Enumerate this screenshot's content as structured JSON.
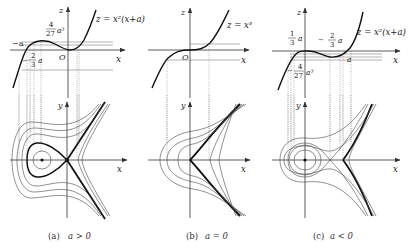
{
  "figure": {
    "panels": [
      {
        "id": "a",
        "caption": "(a)  a > 0",
        "caption_tag": "(a)",
        "caption_cond": "a > 0",
        "upper": {
          "axis_z": "z",
          "axis_x": "x",
          "origin": "O",
          "curve_label": "z = x²(x+a)",
          "labels": [
            {
              "text": "−a",
              "role": "root"
            },
            {
              "text": "4",
              "role": "max-num"
            },
            {
              "text": "27",
              "role": "max-den"
            },
            {
              "text": "a³",
              "role": "max-var"
            },
            {
              "text": "2",
              "role": "crit-num"
            },
            {
              "text": "3",
              "role": "crit-den"
            },
            {
              "text": "a",
              "role": "crit-var"
            }
          ]
        },
        "lower": {
          "axis_y": "y",
          "axis_x": "x"
        }
      },
      {
        "id": "b",
        "caption": "(b)  a = 0",
        "caption_tag": "(b)",
        "caption_cond": "a = 0",
        "upper": {
          "axis_z": "z",
          "axis_x": "x",
          "origin": "O",
          "curve_label": "z = x³"
        },
        "lower": {
          "axis_y": "y",
          "axis_x": "x"
        }
      },
      {
        "id": "c",
        "caption": "(c)  a < 0",
        "caption_tag": "(c)",
        "caption_cond": "a < 0",
        "upper": {
          "axis_z": "z",
          "axis_x": "x",
          "curve_label": "z = x²(x+a)",
          "labels": [
            {
              "text": "1",
              "role": "a3-num"
            },
            {
              "text": "3",
              "role": "a3-den"
            },
            {
              "text": "a",
              "role": "a3-var"
            },
            {
              "text": "−",
              "role": "crit-sign"
            },
            {
              "text": "2",
              "role": "crit-num"
            },
            {
              "text": "3",
              "role": "crit-den"
            },
            {
              "text": "a",
              "role": "crit-var"
            },
            {
              "text": "−",
              "role": "min-sign"
            },
            {
              "text": "4",
              "role": "min-num"
            },
            {
              "text": "27",
              "role": "min-den"
            },
            {
              "text": "a³",
              "role": "min-var"
            },
            {
              "text": "a",
              "role": "root"
            }
          ]
        },
        "lower": {
          "axis_y": "y",
          "axis_x": "x"
        }
      }
    ]
  }
}
